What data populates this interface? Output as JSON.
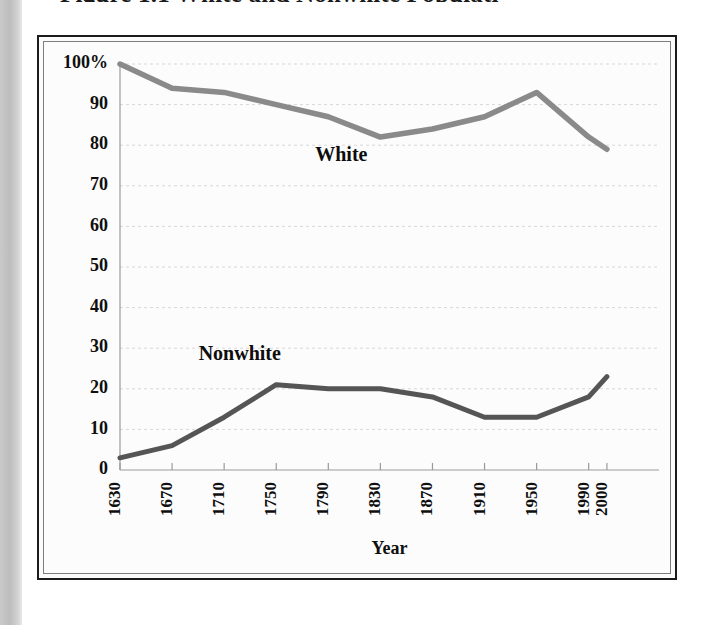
{
  "figure": {
    "title": "Figure 1.1 White and Nonwhite Population",
    "frame_border_color": "#1b1b1b",
    "plot_background": "#fcfcfc"
  },
  "chart_data": {
    "type": "line",
    "title": "",
    "xlabel": "Year",
    "ylabel": "",
    "grid": true,
    "legend_position": "inline-labels",
    "xlim": [
      1630,
      2000
    ],
    "ylim": [
      0,
      100
    ],
    "x": [
      1630,
      1670,
      1710,
      1750,
      1790,
      1830,
      1870,
      1910,
      1950,
      1990,
      2000
    ],
    "categories": [
      "1630",
      "1670",
      "1710",
      "1750",
      "1790",
      "1830",
      "1870",
      "1910",
      "1950",
      "1990",
      "2000"
    ],
    "ytick_labels": [
      "100%",
      "90",
      "80",
      "70",
      "60",
      "50",
      "40",
      "30",
      "20",
      "10",
      "0"
    ],
    "ytick_values": [
      100,
      90,
      80,
      70,
      60,
      50,
      40,
      30,
      20,
      10,
      0
    ],
    "series": [
      {
        "name": "White",
        "color": "#8a8a8a",
        "values": [
          100,
          94,
          93,
          90,
          87,
          82,
          84,
          87,
          93,
          82,
          79
        ],
        "label_x": 1800,
        "label_y": 76
      },
      {
        "name": "Nonwhite",
        "color": "#555555",
        "values": [
          3,
          6,
          13,
          21,
          20,
          20,
          18,
          13,
          13,
          18,
          23
        ],
        "label_x": 1722,
        "label_y": 27
      }
    ],
    "annotations": [
      {
        "text": "White",
        "x": 1800,
        "y": 76
      },
      {
        "text": "Nonwhite",
        "x": 1722,
        "y": 27
      }
    ]
  }
}
